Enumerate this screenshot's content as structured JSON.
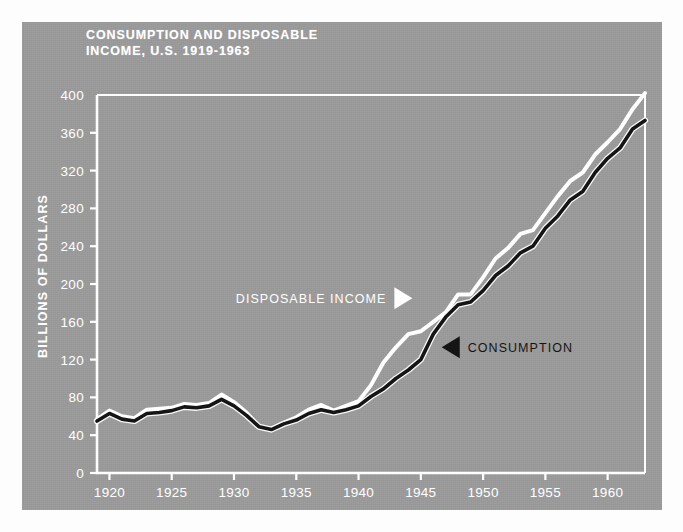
{
  "figure": {
    "panel_color": "#9c9c9c",
    "background": "#ffffff",
    "title_line1": "CONSUMPTION AND DISPOSABLE",
    "title_line2": "INCOME, U.S. 1919-1963"
  },
  "chart_data": {
    "type": "line",
    "title": "CONSUMPTION AND DISPOSABLE INCOME, U.S. 1919-1963",
    "xlabel": "",
    "ylabel": "BILLIONS OF DOLLARS",
    "xlim": [
      1919,
      1963
    ],
    "ylim": [
      0,
      400
    ],
    "xticks": [
      1920,
      1925,
      1930,
      1935,
      1940,
      1945,
      1950,
      1955,
      1960
    ],
    "yticks": [
      0,
      40,
      80,
      120,
      160,
      200,
      240,
      280,
      320,
      360,
      400
    ],
    "grid": false,
    "legend_position": "inline-annotation",
    "x": [
      1919,
      1920,
      1921,
      1922,
      1923,
      1924,
      1925,
      1926,
      1927,
      1928,
      1929,
      1930,
      1931,
      1932,
      1933,
      1934,
      1935,
      1936,
      1937,
      1938,
      1939,
      1940,
      1941,
      1942,
      1943,
      1944,
      1945,
      1946,
      1947,
      1948,
      1949,
      1950,
      1951,
      1952,
      1953,
      1954,
      1955,
      1956,
      1957,
      1958,
      1959,
      1960,
      1961,
      1962,
      1963
    ],
    "series": [
      {
        "name": "DISPOSABLE INCOME",
        "color": "#ffffff",
        "values": [
          57,
          66,
          60,
          58,
          67,
          68,
          69,
          73,
          72,
          74,
          83,
          75,
          64,
          49,
          46,
          53,
          59,
          67,
          72,
          66,
          71,
          76,
          93,
          117,
          133,
          147,
          150,
          160,
          170,
          189,
          189,
          207,
          227,
          238,
          253,
          257,
          275,
          293,
          309,
          318,
          337,
          350,
          364,
          385,
          402
        ]
      },
      {
        "name": "CONSUMPTION",
        "color": "#151515",
        "values": [
          55,
          63,
          57,
          55,
          63,
          64,
          66,
          70,
          69,
          71,
          78,
          71,
          61,
          49,
          46,
          52,
          56,
          63,
          67,
          64,
          67,
          71,
          81,
          89,
          100,
          109,
          120,
          147,
          165,
          178,
          181,
          193,
          209,
          219,
          233,
          240,
          259,
          272,
          289,
          298,
          318,
          333,
          344,
          364,
          373
        ]
      }
    ],
    "annotations": [
      {
        "text": "DISPOSABLE INCOME",
        "marker": "triangle-right",
        "color": "#ffffff",
        "x": 1944.0,
        "y": 185
      },
      {
        "text": "CONSUMPTION",
        "marker": "triangle-left",
        "color": "#151515",
        "x": 1947.0,
        "y": 133
      }
    ]
  },
  "axes": {
    "y_title": "BILLIONS OF DOLLARS",
    "y_tick_labels": [
      "400",
      "360",
      "320",
      "280",
      "240",
      "200",
      "160",
      "120",
      "80",
      "40",
      "0"
    ],
    "x_tick_labels": [
      "1920",
      "1925",
      "1930",
      "1935",
      "1940",
      "1945",
      "1950",
      "1955",
      "1960"
    ]
  }
}
